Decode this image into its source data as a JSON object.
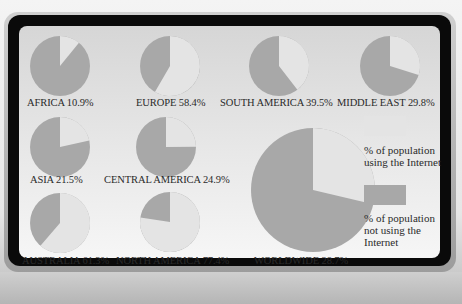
{
  "chart_data": {
    "type": "pie",
    "title": "",
    "colors": {
      "using": "#e4e4e4",
      "not_using": "#a8a8a8"
    },
    "legend": [
      {
        "key": "using",
        "label": "% of population using the Internet"
      },
      {
        "key": "not_using",
        "label": "% of population not using the Internet"
      }
    ],
    "legend_position": "right",
    "series": [
      {
        "name": "AFRICA",
        "using_pct": 10.9,
        "not_using_pct": 89.1,
        "label": "AFRICA 10.9%"
      },
      {
        "name": "EUROPE",
        "using_pct": 58.4,
        "not_using_pct": 41.6,
        "label": "EUROPE 58.4%"
      },
      {
        "name": "SOUTH AMERICA",
        "using_pct": 39.5,
        "not_using_pct": 60.5,
        "label": "SOUTH AMERICA 39.5%"
      },
      {
        "name": "MIDDLE EAST",
        "using_pct": 29.8,
        "not_using_pct": 70.2,
        "label": "MIDDLE EAST 29.8%"
      },
      {
        "name": "ASIA",
        "using_pct": 21.5,
        "not_using_pct": 78.5,
        "label": "ASIA 21.5%"
      },
      {
        "name": "CENTRAL AMERICA",
        "using_pct": 24.9,
        "not_using_pct": 75.1,
        "label": "CENTRAL AMERICA 24.9%"
      },
      {
        "name": "AUSTRALIA",
        "using_pct": 61.3,
        "not_using_pct": 38.7,
        "label": "AUSTRALIA 61.3%"
      },
      {
        "name": "NORTH AMERICA",
        "using_pct": 77.4,
        "not_using_pct": 22.6,
        "label": "NORTH AMERICA 77.4%"
      },
      {
        "name": "WORLDWIDE",
        "using_pct": 28.7,
        "not_using_pct": 71.3,
        "label": "WORLDWIDE 28.7%"
      }
    ]
  },
  "layout": {
    "pies": [
      {
        "cx": 60,
        "cy": 66,
        "r": 30
      },
      {
        "cx": 170,
        "cy": 66,
        "r": 30
      },
      {
        "cx": 279,
        "cy": 66,
        "r": 30
      },
      {
        "cx": 390,
        "cy": 66,
        "r": 30
      },
      {
        "cx": 60,
        "cy": 147,
        "r": 30
      },
      {
        "cx": 166,
        "cy": 147,
        "r": 30
      },
      {
        "cx": 60,
        "cy": 223,
        "r": 30
      },
      {
        "cx": 170,
        "cy": 222,
        "r": 30
      },
      {
        "cx": 313,
        "cy": 190,
        "r": 62
      }
    ],
    "labels": [
      {
        "x": 27,
        "y": 97
      },
      {
        "x": 136,
        "y": 97
      },
      {
        "x": 220,
        "y": 97
      },
      {
        "x": 337,
        "y": 97
      },
      {
        "x": 30,
        "y": 174
      },
      {
        "x": 104,
        "y": 174
      },
      {
        "x": 22,
        "y": 255
      },
      {
        "x": 116,
        "y": 255
      },
      {
        "x": 254,
        "y": 255
      }
    ]
  }
}
